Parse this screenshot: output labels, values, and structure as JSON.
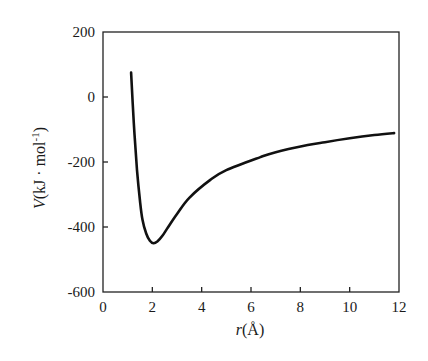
{
  "chart_data": {
    "type": "line",
    "title": "",
    "xlabel": "r(Å)",
    "xlabel_var": "r",
    "xlabel_unit": "(Å)",
    "ylabel": "V(kJ · mol-1)",
    "ylabel_var": "V",
    "ylabel_unit": "(kJ · mol",
    "ylabel_sup": "-1",
    "ylabel_close": ")",
    "xlim": [
      0,
      12
    ],
    "ylim": [
      -600,
      200
    ],
    "xticks": [
      0,
      2,
      4,
      6,
      8,
      10,
      12
    ],
    "yticks": [
      200,
      0,
      -200,
      -400,
      -600
    ],
    "xtick_labels": [
      "0",
      "2",
      "4",
      "6",
      "8",
      "10",
      "12"
    ],
    "ytick_labels": [
      "200",
      "0",
      "-200",
      "-400",
      "-600"
    ],
    "grid": false,
    "legend": null,
    "frame": "box",
    "series": [
      {
        "name": "V(r)",
        "color": "#111111",
        "x": [
          1.14,
          1.25,
          1.38,
          1.5,
          1.6,
          1.75,
          1.9,
          2.05,
          2.2,
          2.4,
          2.6,
          3.0,
          3.5,
          4.35,
          5.0,
          6.38,
          7.0,
          8.3,
          9.0,
          10.0,
          11.0,
          11.8
        ],
        "y": [
          75,
          -80,
          -225,
          -320,
          -378,
          -420,
          -442,
          -450,
          -445,
          -428,
          -405,
          -360,
          -310,
          -255,
          -225,
          -185,
          -170,
          -148,
          -139,
          -127,
          -117,
          -111
        ]
      }
    ]
  }
}
